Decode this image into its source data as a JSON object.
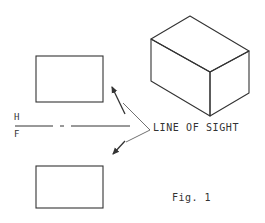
{
  "figure": {
    "caption": "Fig. 1",
    "annotation": "LINE OF SIGHT",
    "plane_labels": {
      "upper": "H",
      "lower": "F"
    },
    "colors": {
      "stroke": "#333333",
      "background": "#ffffff"
    },
    "elements": [
      "isometric-box",
      "top-view-rectangle",
      "front-view-rectangle",
      "fold-line-H-F",
      "line-of-sight-arrows"
    ]
  }
}
